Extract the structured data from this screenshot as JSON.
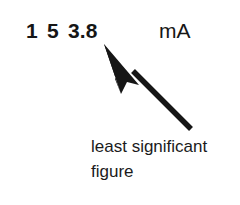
{
  "figure": {
    "background_color": "#ffffff",
    "ink_color": "#161616"
  },
  "reading": {
    "full_value": "1 5 3.8",
    "digits": [
      {
        "text": "1"
      },
      {
        "text": "5"
      },
      {
        "text": "3.8"
      }
    ],
    "unit": "mA"
  },
  "annotation": {
    "arrow": {
      "icon": "arrow-up-left-icon",
      "color": "#161616",
      "tip_x": 104,
      "tip_y": 44,
      "tail_x": 191,
      "tail_y": 129
    },
    "caption_lines": [
      {
        "text": "least significant"
      },
      {
        "text": "figure"
      }
    ],
    "caption_full": "least significant figure"
  }
}
